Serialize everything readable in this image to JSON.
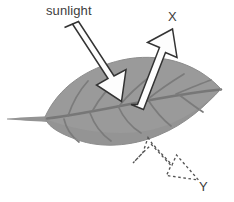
{
  "figure": {
    "type": "diagram",
    "title": "",
    "background_color": "#ffffff"
  },
  "labels": {
    "sunlight": "sunlight",
    "x": "X",
    "y": "Y"
  },
  "colors": {
    "leaf_fill": "#9a9a9a",
    "leaf_shadow": "#8e8e8e",
    "vein": "#7b7b7b",
    "midrib": "#777777",
    "petiole": "#949494",
    "arrow_fill": "#fdfdfd",
    "arrow_stroke": "#333333",
    "dashed_stroke": "#555555",
    "text": "#3d3d3d"
  },
  "elements": {
    "leaf": {
      "name": "leaf",
      "description": "gray elliptical leaf angled down-left to up-right with midrib and lateral veins",
      "tip_x": 222,
      "tip_y": 90,
      "base_x": 46,
      "base_y": 117
    },
    "petiole": {
      "name": "petiole",
      "description": "thin stem extending left from leaf base",
      "from_x": 7,
      "from_y": 118,
      "to_x": 47,
      "to_y": 117
    },
    "incoming_arrow": {
      "name": "sunlight-arrow",
      "direction": "down-right",
      "tail_x": 64,
      "tail_y": 28,
      "head_x": 121,
      "head_y": 101
    },
    "reflected_arrow": {
      "name": "x-arrow",
      "direction": "up-right",
      "tail_x": 131,
      "tail_y": 104,
      "head_x": 172,
      "head_y": 30
    },
    "transmitted_arrow": {
      "name": "y-arrow",
      "direction": "down-right",
      "style": "dashed-outline",
      "tail_x": 148,
      "tail_y": 138,
      "head_x": 199,
      "head_y": 180
    }
  }
}
